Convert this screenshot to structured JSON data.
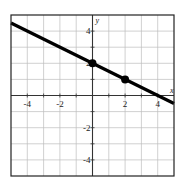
{
  "chart_data": {
    "type": "line",
    "title": "",
    "xlabel": "x",
    "ylabel": "y",
    "xlim": [
      -5,
      5
    ],
    "ylim": [
      -5,
      5
    ],
    "grid": true,
    "grid_step": 1,
    "x_ticks": [
      -4,
      -2,
      2,
      4
    ],
    "y_ticks": [
      4,
      2,
      -2,
      -4
    ],
    "x_tick_labels": [
      "-4",
      "-2",
      "2",
      "4"
    ],
    "y_tick_labels": [
      "4",
      "2",
      "-2",
      "-4"
    ],
    "series": [
      {
        "name": "line",
        "equation": "y = -0.5x + 2",
        "x": [
          -5,
          5
        ],
        "values": [
          4.5,
          -0.5
        ],
        "color": "#000000"
      }
    ],
    "points": [
      {
        "x": 0,
        "y": 2
      },
      {
        "x": 2,
        "y": 1
      }
    ],
    "legend": null
  },
  "colors": {
    "grid": "#bdbdbd",
    "axis": "#333333",
    "frame": "#222222",
    "line": "#000000"
  }
}
